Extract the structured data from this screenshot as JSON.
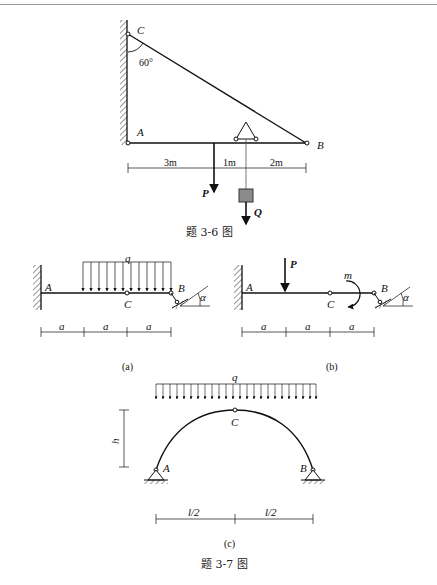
{
  "figure_3_6": {
    "caption": "题 3-6 图",
    "labels": {
      "C": "C",
      "A": "A",
      "B": "B",
      "angle": "60°",
      "P": "P",
      "Q": "Q"
    },
    "dimensions": [
      "3m",
      "1m",
      "2m"
    ]
  },
  "figure_3_7": {
    "caption": "题 3-7 图",
    "sub_a": {
      "tag": "(a)",
      "labels": {
        "q": "q",
        "A": "A",
        "B": "B",
        "C": "C",
        "alpha": "α"
      },
      "dimensions": [
        "a",
        "a",
        "a"
      ]
    },
    "sub_b": {
      "tag": "(b)",
      "labels": {
        "P": "P",
        "m": "m",
        "A": "A",
        "B": "B",
        "C": "C",
        "alpha": "α"
      },
      "dimensions": [
        "a",
        "a",
        "a"
      ]
    },
    "sub_c": {
      "tag": "(c)",
      "labels": {
        "q": "q",
        "C": "C",
        "A": "A",
        "B": "B",
        "h": "h"
      },
      "dimensions": [
        "l/2",
        "l/2"
      ]
    }
  }
}
